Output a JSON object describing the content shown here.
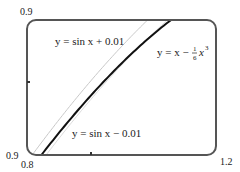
{
  "chart_data": {
    "type": "line",
    "title": "",
    "xlabel": "",
    "ylabel": "",
    "xlim": [
      0.8,
      1.2
    ],
    "ylim": [
      0.7,
      0.9
    ],
    "grid": false,
    "legend": "inline-labels",
    "tick_labels": {
      "x_left": "0.8",
      "x_right": "1.2",
      "y_top": "0.9",
      "y_bottom": "0.9"
    },
    "series": [
      {
        "name": "y = sin x + 0.01",
        "color": "#c8c8c8",
        "width": 1,
        "x": [
          0.8,
          0.85,
          0.9,
          0.95,
          1.0,
          1.05,
          1.1,
          1.15,
          1.2
        ],
        "values": [
          0.727,
          0.761,
          0.793,
          0.823,
          0.851,
          0.877,
          0.901,
          0.923,
          0.942
        ]
      },
      {
        "name": "y = sin x − 0.01",
        "color": "#dcdcdc",
        "width": 1,
        "x": [
          0.8,
          0.85,
          0.9,
          0.95,
          1.0,
          1.05,
          1.1,
          1.15,
          1.2
        ],
        "values": [
          0.707,
          0.741,
          0.773,
          0.803,
          0.831,
          0.857,
          0.881,
          0.903,
          0.922
        ]
      },
      {
        "name": "y = x − (1/6)x³",
        "color": "#111111",
        "width": 2,
        "x": [
          0.8,
          0.85,
          0.9,
          0.95,
          1.0,
          1.05,
          1.1,
          1.15,
          1.2
        ],
        "values": [
          0.715,
          0.748,
          0.779,
          0.807,
          0.833,
          0.857,
          0.878,
          0.897,
          0.912
        ]
      }
    ],
    "annotations": [
      {
        "text": "y = sin x + 0.01",
        "x_px": 55,
        "y_px": 45
      },
      {
        "text": "y = sin x − 0.01",
        "x_px": 72,
        "y_px": 137
      },
      {
        "text": "y = x − ",
        "x_px": 157,
        "y_px": 56,
        "frac_num": "1",
        "frac_den": "6",
        "tail": "x",
        "exp": "3"
      }
    ]
  }
}
